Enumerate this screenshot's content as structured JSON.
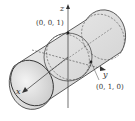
{
  "diagram": {
    "type": "3d-cylinder-with-axes",
    "axes": {
      "x_label": "x",
      "y_label": "y",
      "z_label": "z"
    },
    "points": [
      {
        "label": "(0, 0, 1)"
      },
      {
        "label": "(0, 1, 0)"
      }
    ],
    "colors": {
      "stroke": "#333333",
      "fill_light": "#e4e4e4",
      "fill_dark": "#cfcfcf",
      "background": "#ffffff"
    }
  }
}
